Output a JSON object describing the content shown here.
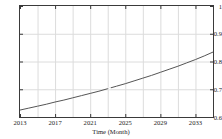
{
  "chart_data": {
    "type": "line",
    "title": "Forecast of Groundwater Abstraction",
    "xlabel": "Time (Month)",
    "ylabel": "",
    "xlim": [
      2013,
      2035
    ],
    "ylim": [
      0.6,
      1.0
    ],
    "grid": true,
    "legend": "none",
    "x_tick_labels": [
      "2013",
      "2017",
      "2021",
      "2025",
      "2029",
      "2033"
    ],
    "x_tick_values": [
      2013,
      2017,
      2021,
      2025,
      2029,
      2033
    ],
    "x_minor_gridlines": [
      2015,
      2017,
      2019,
      2021,
      2023,
      2025,
      2027,
      2029,
      2031,
      2033
    ],
    "y_tick_labels": [
      "1",
      "0.9",
      "0.8",
      "0.7",
      "0.6"
    ],
    "y_tick_values": [
      1,
      0.9,
      0.8,
      0.7,
      0.6
    ],
    "series": [
      {
        "name": "forecast",
        "color": "#555555",
        "x": [
          2013,
          2014,
          2015,
          2016,
          2017,
          2018,
          2019,
          2020,
          2021,
          2022,
          2023,
          2024,
          2025,
          2026,
          2027,
          2028,
          2029,
          2030,
          2031,
          2032,
          2033,
          2034,
          2035
        ],
        "values": [
          0.625,
          0.632,
          0.639,
          0.646,
          0.654,
          0.661,
          0.669,
          0.677,
          0.685,
          0.693,
          0.702,
          0.711,
          0.72,
          0.73,
          0.74,
          0.75,
          0.761,
          0.772,
          0.783,
          0.795,
          0.807,
          0.82,
          0.834
        ]
      }
    ],
    "annotations": [
      {
        "name": "series-break-marker",
        "x": 2023.2,
        "y": 0.7035
      }
    ]
  },
  "axes": {
    "y_labels": [
      {
        "text": "1",
        "value": 1.0
      },
      {
        "text": "0.9",
        "value": 0.9
      },
      {
        "text": "0.8",
        "value": 0.8
      },
      {
        "text": "0.7",
        "value": 0.7
      },
      {
        "text": "0.6",
        "value": 0.6
      }
    ],
    "x_labels": [
      {
        "text": "2013",
        "value": 2013
      },
      {
        "text": "2017",
        "value": 2017
      },
      {
        "text": "2021",
        "value": 2021
      },
      {
        "text": "2025",
        "value": 2025
      },
      {
        "text": "2029",
        "value": 2029
      },
      {
        "text": "2033",
        "value": 2033
      }
    ],
    "xlabel": "Time (Month)"
  },
  "style": {
    "background": "#ffffff",
    "frame_color": "#3a3a3a",
    "grid_color": "#dcdcdc",
    "line_color": "#555555",
    "text_color": "#1c1c1c",
    "title_color": "#6a6a6a"
  }
}
